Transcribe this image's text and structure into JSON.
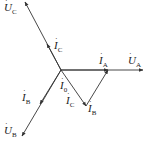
{
  "diagram": {
    "type": "phasor-diagram",
    "origin": [
      61,
      70
    ],
    "line_color": "#333333",
    "phasors": [
      {
        "id": "U_A",
        "symbol": "U",
        "sub": "A",
        "from": [
          61,
          70
        ],
        "to": [
          143,
          70
        ]
      },
      {
        "id": "I_A",
        "symbol": "I",
        "sub": "A",
        "from": [
          61,
          70
        ],
        "to": [
          108,
          70
        ]
      },
      {
        "id": "U_C",
        "symbol": "U",
        "sub": "C",
        "from": [
          61,
          70
        ],
        "to": [
          25,
          2
        ]
      },
      {
        "id": "I_C_up",
        "symbol": "I",
        "sub": "C",
        "from": [
          61,
          70
        ],
        "to": [
          47,
          44
        ]
      },
      {
        "id": "U_B",
        "symbol": "U",
        "sub": "B",
        "from": [
          61,
          70
        ],
        "to": [
          22,
          136
        ]
      },
      {
        "id": "I_B_down",
        "symbol": "I",
        "sub": "B",
        "from": [
          61,
          70
        ],
        "to": [
          40,
          104
        ]
      },
      {
        "id": "I_C_tri",
        "symbol": "I",
        "sub": "C",
        "from": [
          61,
          70
        ],
        "to": [
          86,
          106
        ]
      },
      {
        "id": "I_B_tri",
        "symbol": "I",
        "sub": "B",
        "from": [
          86,
          106
        ],
        "to": [
          108,
          70
        ]
      }
    ],
    "labels": {
      "U_C": {
        "symbol": "U",
        "sub": "C",
        "x": 4,
        "y": 2
      },
      "I_C_upper": {
        "symbol": "I",
        "sub": "C",
        "x": 54,
        "y": 40
      },
      "I_A": {
        "symbol": "I",
        "sub": "A",
        "x": 99,
        "y": 55
      },
      "U_A": {
        "symbol": "U",
        "sub": "A",
        "x": 128,
        "y": 55
      },
      "I_B_left": {
        "symbol": "I",
        "sub": "B",
        "x": 22,
        "y": 92
      },
      "I_0": {
        "symbol": "I",
        "sub": "0",
        "x": 60,
        "y": 82
      },
      "I_C_lower": {
        "symbol": "I",
        "sub": "C",
        "x": 66,
        "y": 95
      },
      "I_B_lower": {
        "symbol": "I",
        "sub": "B",
        "x": 88,
        "y": 103
      },
      "U_B": {
        "symbol": "U",
        "sub": "B",
        "x": 4,
        "y": 125
      }
    }
  }
}
